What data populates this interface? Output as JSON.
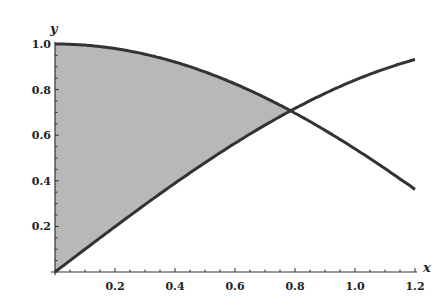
{
  "chart_data": {
    "type": "area",
    "title": "",
    "xlabel": "x",
    "ylabel": "y",
    "xlim": [
      0,
      1.2
    ],
    "ylim": [
      0,
      1.0
    ],
    "grid": false,
    "x_ticks": [
      "0.2",
      "0.4",
      "0.6",
      "0.8",
      "1.0",
      "1.2"
    ],
    "y_ticks": [
      "0.2",
      "0.4",
      "0.6",
      "0.8",
      "1.0"
    ],
    "series": [
      {
        "name": "y = cos x",
        "x": [
          0,
          0.2,
          0.4,
          0.6,
          0.8,
          1.0,
          1.2
        ],
        "values": [
          1.0,
          0.98,
          0.921,
          0.825,
          0.697,
          0.54,
          0.362
        ]
      },
      {
        "name": "y = sin x",
        "x": [
          0,
          0.2,
          0.4,
          0.6,
          0.8,
          1.0,
          1.2
        ],
        "values": [
          0.0,
          0.199,
          0.389,
          0.565,
          0.717,
          0.841,
          0.932
        ]
      }
    ],
    "shaded_region": {
      "between": [
        "y = cos x",
        "y = sin x"
      ],
      "x_from": 0,
      "x_to": 0.785,
      "color": "#b8b8b8"
    },
    "curve_color": "#333333"
  },
  "axes": {
    "x_name": "x",
    "y_name": "y"
  }
}
